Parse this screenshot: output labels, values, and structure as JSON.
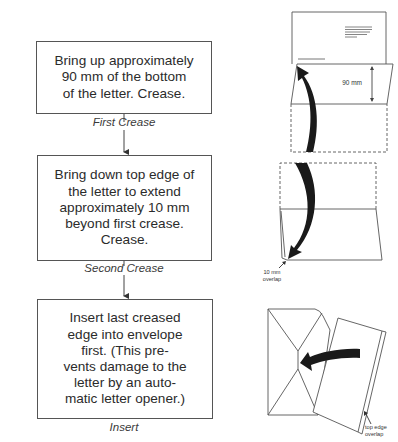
{
  "steps": [
    {
      "text": "Bring up approximately\n90 mm of the bottom\nof the letter. Crease.",
      "caption": "First Crease"
    },
    {
      "text": "Bring down top edge of\nthe letter to extend\napproximately 10 mm\nbeyond first crease.\nCrease.",
      "caption": "Second Crease"
    },
    {
      "text": "Insert last creased\nedge into envelope\nfirst. (This pre-\nvents damage to the\nletter by an auto-\nmatic letter opener.)",
      "caption": "Insert"
    }
  ],
  "illustrations": {
    "first": {
      "dimension_label": "90 mm"
    },
    "second": {
      "label_line1": "10 mm",
      "label_line2": "overlap"
    },
    "third": {
      "label_line1": "top edge",
      "label_line2": "overlap"
    }
  }
}
